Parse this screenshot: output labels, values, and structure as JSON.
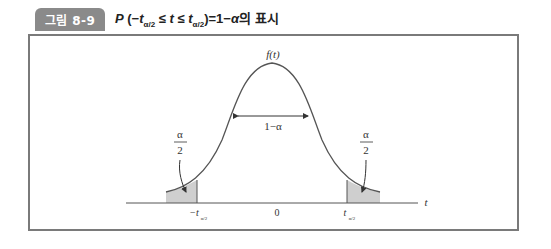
{
  "figure": {
    "tag_label": "그림 8-9"
  },
  "diagram": {
    "curve_label": "f(t)",
    "center_label": "1−α",
    "tail_left_label_num": "α",
    "tail_left_label_den": "2",
    "tail_right_label_num": "α",
    "tail_right_label_den": "2",
    "axis_label": "t",
    "tick_left": "−t",
    "tick_left_sub": "α/2",
    "tick_center": "0",
    "tick_right": "t",
    "tick_right_sub": "α/2",
    "shade_color": "#cfcfcf",
    "line_color": "#555555"
  }
}
